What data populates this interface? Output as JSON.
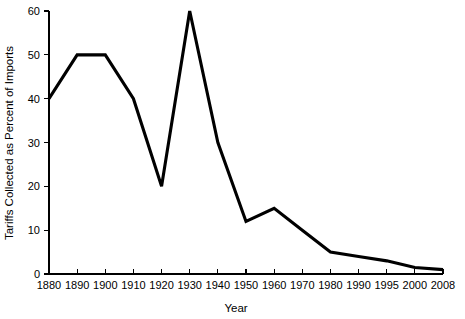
{
  "chart_data": {
    "type": "line",
    "title": "",
    "subtitle": "",
    "xlabel": "Year",
    "ylabel": "Tariffs Collected as Percent of Imports",
    "categories": [
      "1880",
      "1890",
      "1900",
      "1910",
      "1920",
      "1930",
      "1940",
      "1950",
      "1960",
      "1970",
      "1980",
      "1990",
      "1995",
      "2000",
      "2008"
    ],
    "values": [
      40,
      50,
      50,
      40,
      20,
      60,
      30,
      12,
      15,
      10,
      5,
      4,
      3,
      1.5,
      1
    ],
    "series": [
      {
        "name": "Tariffs Collected as Percent of Imports",
        "values": [
          40,
          50,
          50,
          40,
          20,
          60,
          30,
          12,
          15,
          10,
          5,
          4,
          3,
          1.5,
          1
        ],
        "color": "#000000"
      }
    ],
    "ylim": [
      0,
      60
    ],
    "yticks": [
      0,
      10,
      20,
      30,
      40,
      50,
      60
    ],
    "ytick_labels": [
      "0",
      "10",
      "20",
      "30",
      "40",
      "50",
      "60"
    ],
    "xtick_labels": [
      "1880",
      "1890",
      "1900",
      "1910",
      "1920",
      "1930",
      "1940",
      "1950",
      "1960",
      "1970",
      "1980",
      "1990",
      "1995",
      "2000",
      "2008"
    ],
    "grid": false,
    "legend": false,
    "legend_position": "none",
    "annotations": [],
    "axis_note": "x axis is categorical: evenly spaced tick positions for unevenly spaced years",
    "background_color": "#ffffff",
    "line_color": "#000000"
  }
}
